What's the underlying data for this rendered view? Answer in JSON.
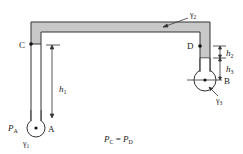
{
  "diagram": {
    "type": "inverted U-tube manometer between two pipes",
    "colors": {
      "fluid_2_fill": "#c8c8c8",
      "stroke": "#333333",
      "background": "#ffffff"
    },
    "labels": {
      "point_c": "C",
      "point_d": "D",
      "point_a": "A",
      "point_b": "B",
      "gamma_1": "γ",
      "gamma_1_sub": "1",
      "gamma_2": "γ",
      "gamma_2_sub": "2",
      "gamma_3": "γ",
      "gamma_3_sub": "3",
      "h1": "h",
      "h1_sub": "1",
      "h2": "h",
      "h2_sub": "2",
      "h3": "h",
      "h3_sub": "3",
      "pa": "P",
      "pa_sub": "A",
      "equation_lhs": "P",
      "equation_lhs_sub": "C",
      "equation_eq": " = ",
      "equation_rhs": "P",
      "equation_rhs_sub": "D"
    }
  }
}
